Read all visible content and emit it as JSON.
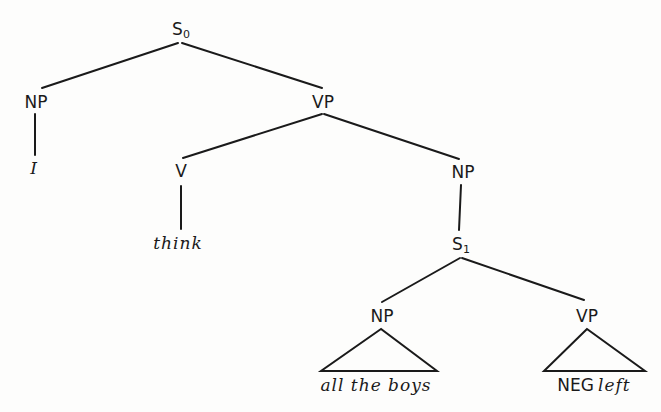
{
  "diagram": {
    "type": "syntax-tree",
    "nodes": {
      "s0": {
        "label": "S",
        "subscript": "0"
      },
      "np_subject": {
        "label": "NP"
      },
      "pronoun": {
        "text": "I"
      },
      "vp_main": {
        "label": "VP"
      },
      "v": {
        "label": "V"
      },
      "verb": {
        "text": "think"
      },
      "np_object": {
        "label": "NP"
      },
      "s1": {
        "label": "S",
        "subscript": "1"
      },
      "np_embedded": {
        "label": "NP"
      },
      "np_embedded_text": {
        "text": "all the boys"
      },
      "vp_embedded": {
        "label": "VP"
      },
      "vp_embedded_neg": {
        "text": "NEG"
      },
      "vp_embedded_verb": {
        "text": "left"
      }
    },
    "edges": [
      [
        "S0",
        "NP"
      ],
      [
        "S0",
        "VP"
      ],
      [
        "NP",
        "I"
      ],
      [
        "VP",
        "V"
      ],
      [
        "VP",
        "NP"
      ],
      [
        "V",
        "think"
      ],
      [
        "NP",
        "S1"
      ],
      [
        "S1",
        "NP"
      ],
      [
        "S1",
        "VP"
      ],
      [
        "NP",
        "triangle:all the boys"
      ],
      [
        "VP",
        "triangle:NEG left"
      ]
    ],
    "colors": {
      "ink": "#1a1a1a",
      "paper": "#fdfdfc"
    }
  }
}
